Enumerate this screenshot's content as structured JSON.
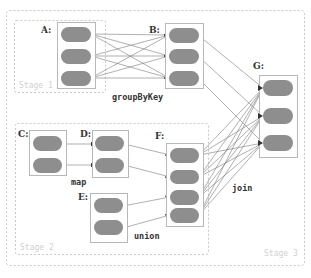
{
  "diagram": {
    "colors": {
      "partition": "#8e8e8e",
      "rdd_border": "#b8b8b8",
      "stage_border": "#c8c8c8",
      "edge": "#7a7a7a",
      "stage_label": "#d0d0d0"
    },
    "stages": [
      {
        "id": "stage1",
        "label": "Stage 1"
      },
      {
        "id": "stage2",
        "label": "Stage 2"
      },
      {
        "id": "stage3",
        "label": "Stage 3"
      }
    ],
    "rdds": [
      {
        "id": "A",
        "label": "A:",
        "partitions": 3,
        "stage": "stage1"
      },
      {
        "id": "B",
        "label": "B:",
        "partitions": 3,
        "stage": "stage3"
      },
      {
        "id": "C",
        "label": "C:",
        "partitions": 2,
        "stage": "stage2"
      },
      {
        "id": "D",
        "label": "D:",
        "partitions": 2,
        "stage": "stage2"
      },
      {
        "id": "E",
        "label": "E:",
        "partitions": 2,
        "stage": "stage2"
      },
      {
        "id": "F",
        "label": "F:",
        "partitions": 4,
        "stage": "stage2"
      },
      {
        "id": "G",
        "label": "G:",
        "partitions": 3,
        "stage": "stage3"
      }
    ],
    "operations": [
      {
        "id": "groupByKey",
        "label": "groupByKey",
        "from": "A",
        "to": "B",
        "dependency": "wide"
      },
      {
        "id": "map",
        "label": "map",
        "from": "C",
        "to": "D",
        "dependency": "narrow"
      },
      {
        "id": "union",
        "label": "union",
        "from": [
          "D",
          "E"
        ],
        "to": "F",
        "dependency": "narrow"
      },
      {
        "id": "join",
        "label": "join",
        "from": [
          "B",
          "F"
        ],
        "to": "G",
        "dependency": "mixed"
      }
    ]
  }
}
